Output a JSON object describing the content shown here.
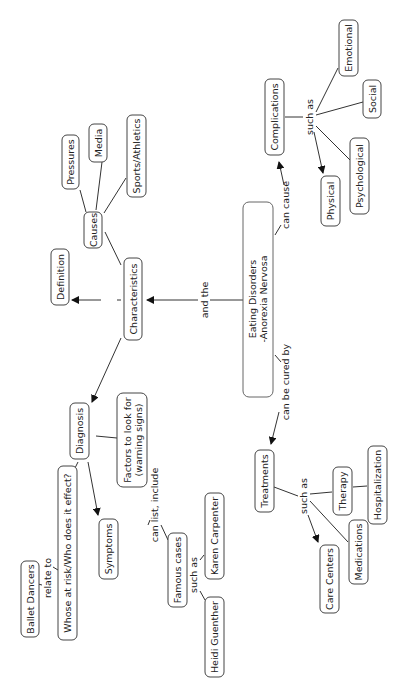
{
  "diagram": {
    "type": "concept-map",
    "orientation": "rotated-90-ccw",
    "root": "Eating Disorders -Anorexia Nervosa",
    "nodes": {
      "root_line1": "Eating Disorders",
      "root_line2": "-Anorexia Nervosa",
      "characteristics": "Characteristics",
      "causes": "Causes",
      "pressures": "Pressures",
      "media": "Media",
      "sports": "Sports/Athletics",
      "definition": "Definition",
      "diagnosis": "Diagnosis",
      "factors_line1": "Factors to look for",
      "factors_line2": "(warning signs)",
      "symptoms": "Symptoms",
      "whose_at_risk": "Whose at risk/Who does it effect?",
      "ballet": "Ballet Dancers",
      "famous": "Famous cases",
      "karen": "Karen Carpenter",
      "heidi": "Heidi Guenther",
      "complications": "Complications",
      "emotional": "Emotional",
      "social": "Social",
      "psychological": "Psychological",
      "physical": "Physical",
      "treatments": "Treatments",
      "therapy": "Therapy",
      "hospitalization": "Hospitalization",
      "medications": "Medications",
      "care_centers": "Care Centers"
    },
    "links": {
      "and_the": "and the",
      "can_cause": "can cause",
      "can_be_cured_by": "can be cured by",
      "such_as_complications": "such as",
      "such_as_treatments": "such as",
      "such_as_famous": "such as",
      "can_list_include": "can list, include",
      "relate_to": "relate to"
    }
  }
}
